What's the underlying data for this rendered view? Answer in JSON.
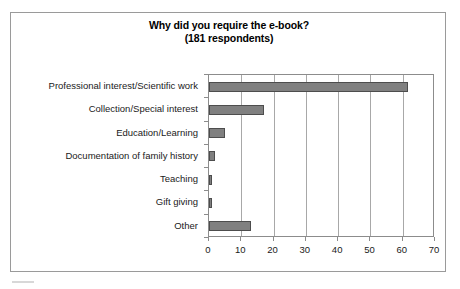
{
  "chart_data": {
    "type": "bar",
    "orientation": "horizontal",
    "title": "Why did you require the e-book?",
    "subtitle": "(181 respondents)",
    "xlabel": "",
    "ylabel": "",
    "categories": [
      "Professional interest/Scientific work",
      "Collection/Special interest",
      "Education/Learning",
      "Documentation of family history",
      "Teaching",
      "Gift giving",
      "Other"
    ],
    "values": [
      61.5,
      17,
      5,
      2,
      1,
      1,
      13
    ],
    "xlim": [
      0,
      70
    ],
    "xticks": [
      0,
      10,
      20,
      30,
      40,
      50,
      60,
      70
    ],
    "xtick_labels": [
      "0",
      "10",
      "20",
      "30",
      "40",
      "50",
      "60",
      "70"
    ],
    "grid": "vertical",
    "legend": "none",
    "series": [
      {
        "name": "Respondents",
        "values": [
          61.5,
          17,
          5,
          2,
          1,
          1,
          13
        ]
      }
    ],
    "colors": {
      "bar_fill": "#808080",
      "bar_edge": "#4d4d4d",
      "gridline": "#a8a8a8",
      "axis": "#8c8c8c",
      "frame": "#9a9a9a",
      "text": "#1a1a1a",
      "background": "#ffffff"
    }
  }
}
